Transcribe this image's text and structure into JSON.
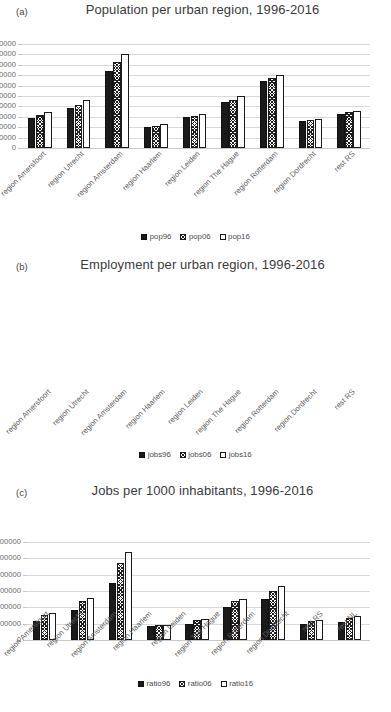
{
  "figure": {
    "background": "#ffffff",
    "series_colors": {
      "s0": "#1a1a1a",
      "s1": "#ffffff-hatch",
      "s2": "#ffffff"
    }
  },
  "panels": [
    {
      "tag": "(a)",
      "title": "Population per urban region, 1996-2016",
      "chart_data": {
        "type": "bar",
        "title": "Population per urban region, 1996-2016",
        "xlabel": "",
        "ylabel": "",
        "ylim": [
          0,
          2000000
        ],
        "ytick_step": 200000,
        "grid": true,
        "legend_position": "bottom",
        "ticks": [
          "0",
          "200000",
          "400000",
          "600000",
          "800000",
          "1000000",
          "1200000",
          "1400000",
          "1600000",
          "1800000",
          "2000000"
        ],
        "categories": [
          "region Amersfoort",
          "region Utrecht",
          "region Amsterdam",
          "region Haarlem",
          "region Leiden",
          "region The Hague",
          "region Rotterdam",
          "region Dordrecht",
          "rest RS"
        ],
        "series": [
          {
            "name": "pop96",
            "values": [
              580000,
              765000,
              1490000,
              400000,
              595000,
              880000,
              1285000,
              515000,
              645000
            ]
          },
          {
            "name": "pop06",
            "values": [
              635000,
              835000,
              1655000,
              430000,
              615000,
              920000,
              1340000,
              545000,
              690000
            ]
          },
          {
            "name": "pop16",
            "values": [
              685000,
              915000,
              1805000,
              460000,
              650000,
              1000000,
              1410000,
              555000,
              715000
            ]
          }
        ]
      },
      "legend": [
        "pop96",
        "pop06",
        "pop16"
      ]
    },
    {
      "tag": "(b)",
      "title": "Employment per urban region, 1996-2016",
      "chart_data": {
        "type": "bar",
        "title": "Employment per urban region, 1996-2016",
        "xlabel": "",
        "ylabel": "",
        "ylim": [
          0,
          1200000
        ],
        "ytick_step": 200000,
        "grid": true,
        "legend_position": "bottom",
        "ticks": [
          "0",
          "200000",
          "400000",
          "600000",
          "800000",
          "1000000",
          "1200000"
        ],
        "categories": [
          "region Amersfoort",
          "region Utrecht",
          "region Amsterdam",
          "region Haarlem",
          "region Leiden",
          "region The Hague",
          "region Rotterdam",
          "region Dordrecht",
          "rest RS"
        ],
        "series": [
          {
            "name": "jobs96",
            "values": [
              228000,
              370000,
              695000,
              170000,
              198000,
              405000,
              500000,
              190000,
              218000
            ]
          },
          {
            "name": "jobs06",
            "values": [
              305000,
              472000,
              940000,
              182000,
              240000,
              478000,
              602000,
              232000,
              272000
            ]
          },
          {
            "name": "jobs16",
            "values": [
              328000,
              512000,
              1080000,
              182000,
              258000,
              505000,
              662000,
              250000,
              288000
            ]
          }
        ]
      },
      "legend": [
        "jobs96",
        "jobs06",
        "jobs16"
      ]
    },
    {
      "tag": "(c)",
      "title": "Jobs per 1000 inhabitants, 1996-2016",
      "chart_data": {
        "type": "bar",
        "title": "Jobs per 1000 inhabitants, 1996-2016",
        "xlabel": "",
        "ylabel": "",
        "ylim": [
          0,
          700
        ],
        "ytick_step": 100,
        "grid": true,
        "legend_position": "bottom",
        "ticks": [
          "0",
          "100",
          "200",
          "300",
          "400",
          "500",
          "600",
          "700"
        ],
        "categories": [
          "region Amersfoort",
          "region Utrecht",
          "region Amsterdam",
          "region Haarlem",
          "region Leiden",
          "region The Hague",
          "region Rotterdam",
          "region Dordrecht",
          "rest RS",
          "rest NL"
        ],
        "series": [
          {
            "name": "ratio96",
            "values": [
              395,
              477,
              458,
              412,
              330,
              452,
              388,
              368,
              337,
              392
            ]
          },
          {
            "name": "ratio06",
            "values": [
              482,
              555,
              572,
              422,
              378,
              512,
              448,
              415,
              388,
              458
            ]
          },
          {
            "name": "ratio16",
            "values": [
              480,
              557,
              605,
              390,
              400,
              502,
              478,
              448,
              398,
              467
            ]
          }
        ]
      },
      "legend": [
        "ratio96",
        "ratio06",
        "ratio16"
      ]
    }
  ]
}
